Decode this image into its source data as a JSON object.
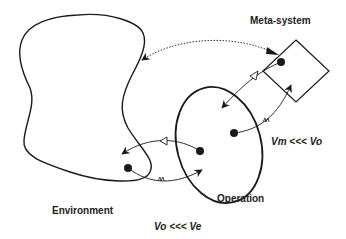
{
  "labels": {
    "meta_system": "Meta-system",
    "operation": "Operation",
    "environment": "Environment",
    "vm_vo": "Vm <<< Vo",
    "vo_ve": "Vo <<< Ve"
  },
  "colors": {
    "stroke": "#1a1a1a",
    "text": "#222222",
    "background": "#ffffff"
  }
}
